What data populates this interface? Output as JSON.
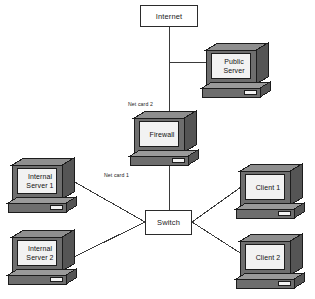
{
  "diagram": {
    "colors": {
      "line": "#3a3a3a",
      "box_border": "#2b2b2b",
      "box_fill": "#ffffff",
      "monitor_front": "#6e6e6e",
      "monitor_top": "#8e8e8e",
      "monitor_side": "#555555",
      "screen": "#f2f2f2",
      "base_top": "#9a9a9a",
      "base_front": "#6e6e6e",
      "outline": "#1c1c1c"
    },
    "boxes": [
      {
        "id": "internet",
        "label": "Internet",
        "x": 140,
        "y": 5,
        "w": 58,
        "h": 22
      },
      {
        "id": "switch",
        "label": "Switch",
        "x": 145,
        "y": 210,
        "w": 47,
        "h": 25
      }
    ],
    "computers": [
      {
        "id": "public-server",
        "label": "Public\nServer",
        "x": 198,
        "y": 41
      },
      {
        "id": "firewall",
        "label": "Firewall",
        "x": 126,
        "y": 109
      },
      {
        "id": "internal-server-1",
        "label": "Internal\nServer 1",
        "x": 4,
        "y": 156
      },
      {
        "id": "internal-server-2",
        "label": "Internal\nServer 2",
        "x": 4,
        "y": 228
      },
      {
        "id": "client-1",
        "label": "Client 1",
        "x": 232,
        "y": 162
      },
      {
        "id": "client-2",
        "label": "Client 2",
        "x": 232,
        "y": 232
      }
    ],
    "captions": [
      {
        "id": "net-card-2",
        "text": "Net card 2",
        "x": 128,
        "y": 101
      },
      {
        "id": "net-card-1",
        "text": "Net card 1",
        "x": 104,
        "y": 172
      }
    ],
    "links": [
      {
        "id": "internet-to-firewall",
        "from": "internet",
        "to": "firewall",
        "points": "169,27 169,112"
      },
      {
        "id": "internet-to-public",
        "from": "internet",
        "to": "public-server",
        "points": "169,62 212,62"
      },
      {
        "id": "firewall-to-switch",
        "from": "firewall",
        "to": "switch",
        "points": "169,166 169,210"
      },
      {
        "id": "switch-to-isrv1",
        "from": "switch",
        "to": "internal-server-1",
        "points": "145,222 66,177"
      },
      {
        "id": "switch-to-isrv2",
        "from": "switch",
        "to": "internal-server-2",
        "points": "145,222 72,258"
      },
      {
        "id": "switch-to-client1",
        "from": "switch",
        "to": "client-1",
        "points": "192,222 248,182"
      },
      {
        "id": "switch-to-client2",
        "from": "switch",
        "to": "client-2",
        "points": "192,222 248,258"
      }
    ]
  }
}
